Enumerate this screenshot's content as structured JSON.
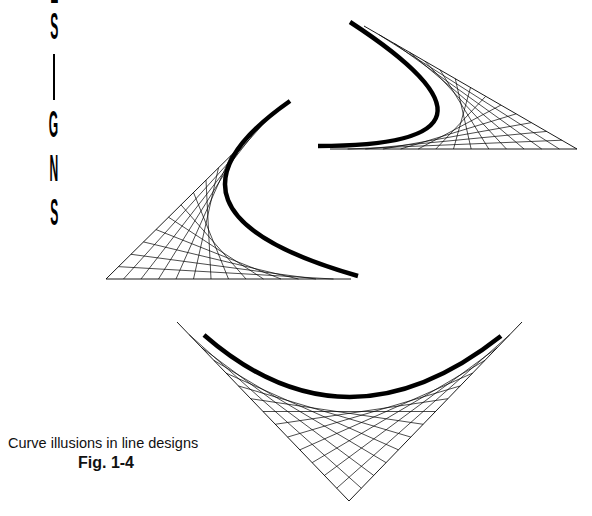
{
  "vertical_title": {
    "letters": [
      "E",
      "S",
      "I",
      "G",
      "N",
      "S"
    ],
    "visible_text": "SIGNS"
  },
  "caption": {
    "text": "Curve illusions in line designs",
    "figure_label": "Fig. 1-4"
  },
  "colors": {
    "ink": "#000000",
    "background": "#ffffff"
  },
  "designs": [
    {
      "name": "top-right-design",
      "vertex": [
        577,
        149
      ],
      "arm_a_end": [
        364,
        26
      ],
      "arm_b_end": [
        330,
        149
      ],
      "divisions": 14,
      "bold_curve": {
        "start": [
          350,
          22
        ],
        "control": [
          490,
          100
        ],
        "end": [
          318,
          146
        ],
        "bend": [
          437,
          115
        ],
        "width": 4.5
      }
    },
    {
      "name": "middle-left-design",
      "vertex": [
        106,
        279
      ],
      "arm_a_end": [
        281,
        106
      ],
      "arm_b_end": [
        351,
        279
      ],
      "divisions": 14,
      "bold_curve": {
        "start": [
          290,
          101
        ],
        "bend": [
          228,
          200
        ],
        "end": [
          358,
          276
        ],
        "width": 4.5
      }
    },
    {
      "name": "bottom-design",
      "vertex": [
        349,
        501
      ],
      "arm_a_end": [
        177,
        322
      ],
      "arm_b_end": [
        522,
        322
      ],
      "divisions": 14,
      "bold_curve": {
        "start": [
          204,
          335
        ],
        "bend": [
          349,
          397
        ],
        "end": [
          501,
          336
        ],
        "width": 4.5
      }
    }
  ]
}
